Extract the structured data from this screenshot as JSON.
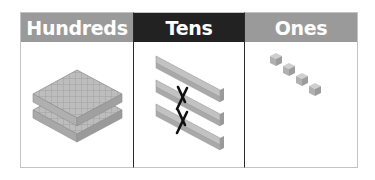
{
  "columns": [
    {
      "label": "Hundreds",
      "header_color": "#9a9a9a",
      "content": "two hundred flats (stacked)",
      "count": 2
    },
    {
      "label": "Tens",
      "header_color": "#222222",
      "content": "three ten rods, two crossed out",
      "count": 3,
      "crossed_out": 2
    },
    {
      "label": "Ones",
      "header_color": "#9a9a9a",
      "content": "four unit cubes",
      "count": 4
    }
  ]
}
